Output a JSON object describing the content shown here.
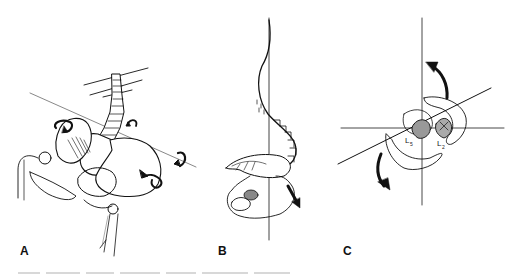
{
  "figure": {
    "panels": [
      {
        "id": "A",
        "label": "A",
        "subject": "pelvis-with-lumbar-spine-rotation"
      },
      {
        "id": "B",
        "label": "B",
        "subject": "sagittal-spine-curve-with-pelvic-tilt"
      },
      {
        "id": "C",
        "label": "C",
        "subject": "axial-vertebra-rotation-view"
      }
    ],
    "vertebra_labels": {
      "l5": "L",
      "l5_sub": "5",
      "l2": "L",
      "l2_sub": "2"
    },
    "colors": {
      "ink": "#111111",
      "background": "#ffffff",
      "axis_line": "#444444"
    }
  }
}
